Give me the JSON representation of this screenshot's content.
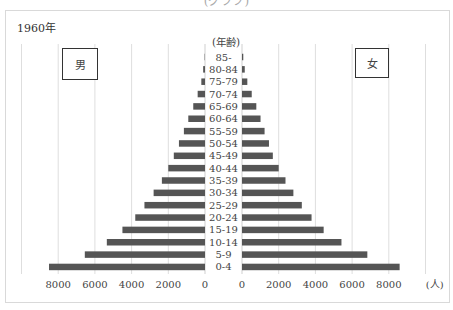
{
  "caption_partial": "(グラフ)",
  "chart_data": {
    "type": "bar",
    "subtype": "population-pyramid",
    "title": "1960年",
    "year": "1960年",
    "age_axis_label": "(年齢)",
    "unit_label": "(人)",
    "male_label": "男",
    "female_label": "女",
    "categories": [
      "85-",
      "80-84",
      "75-79",
      "70-74",
      "65-69",
      "60-64",
      "55-59",
      "50-54",
      "45-49",
      "40-44",
      "35-39",
      "30-34",
      "25-29",
      "20-24",
      "15-19",
      "10-14",
      "5-9",
      "0-4"
    ],
    "series": [
      {
        "name": "男",
        "side": "left",
        "color": "#555555",
        "values": [
          20,
          100,
          200,
          400,
          640,
          910,
          1150,
          1420,
          1700,
          2000,
          2350,
          2800,
          3300,
          3800,
          4500,
          5350,
          6550,
          8500
        ]
      },
      {
        "name": "女",
        "side": "right",
        "color": "#555555",
        "values": [
          70,
          150,
          290,
          530,
          780,
          1010,
          1230,
          1470,
          1680,
          2000,
          2370,
          2800,
          3260,
          3790,
          4450,
          5420,
          6830,
          8590
        ]
      }
    ],
    "xlim": [
      0,
      10000
    ],
    "left_ticks": [
      "8000",
      "6000",
      "4000",
      "2000",
      "0"
    ],
    "right_ticks": [
      "0",
      "2000",
      "4000",
      "6000",
      "8000"
    ],
    "grid": true,
    "legend": "boxes top-left (男) and top-right (女)"
  }
}
